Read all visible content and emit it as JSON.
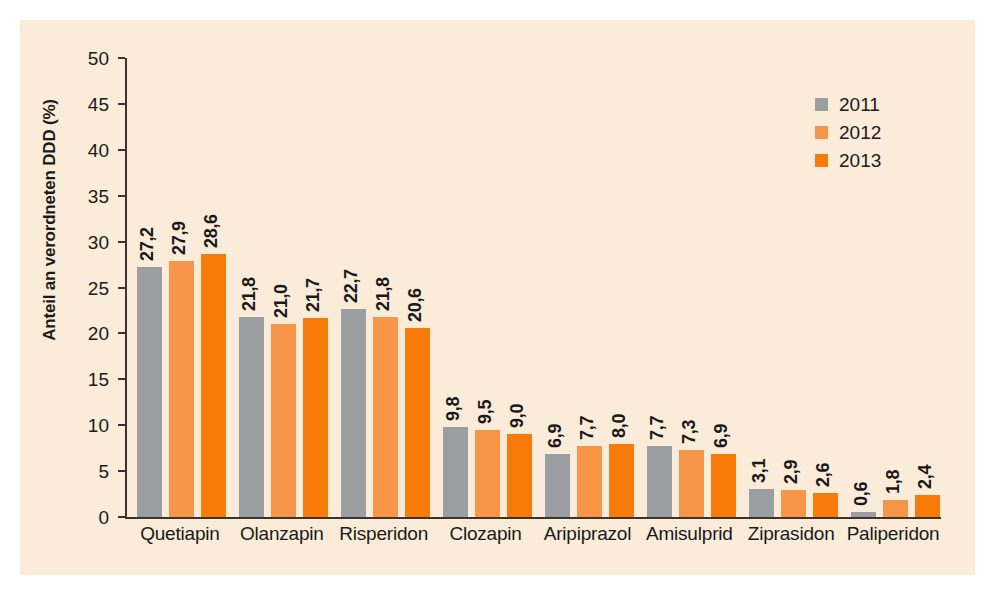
{
  "chart_data": {
    "type": "bar",
    "title": "",
    "xlabel": "",
    "ylabel": "Anteil an verordneten DDD (%)",
    "ylim": [
      0,
      50
    ],
    "ytick_step": 5,
    "yticks": [
      "50",
      "45",
      "40",
      "35",
      "30",
      "25",
      "20",
      "15",
      "10",
      "5",
      "0"
    ],
    "grid": false,
    "legend_position": "top-right",
    "decimal_separator": ",",
    "categories": [
      "Quetiapin",
      "Olanzapin",
      "Risperidon",
      "Clozapin",
      "Aripiprazol",
      "Amisulprid",
      "Ziprasidon",
      "Paliperidon"
    ],
    "series": [
      {
        "name": "2011",
        "color": "#9b9ea1",
        "values": [
          27.2,
          21.8,
          22.7,
          9.8,
          6.9,
          7.7,
          3.1,
          0.6
        ],
        "labels": [
          "27,2",
          "21,8",
          "22,7",
          "9,8",
          "6,9",
          "7,7",
          "3,1",
          "0,6"
        ]
      },
      {
        "name": "2012",
        "color": "#f79548",
        "values": [
          27.9,
          21.0,
          21.8,
          9.5,
          7.7,
          7.3,
          2.9,
          1.8
        ],
        "labels": [
          "27,9",
          "21,0",
          "21,8",
          "9,5",
          "7,7",
          "7,3",
          "2,9",
          "1,8"
        ]
      },
      {
        "name": "2013",
        "color": "#f87a09",
        "values": [
          28.6,
          21.7,
          20.6,
          9.0,
          8.0,
          6.9,
          2.6,
          2.4
        ],
        "labels": [
          "28,6",
          "21,7",
          "20,6",
          "9,0",
          "8,0",
          "6,9",
          "2,6",
          "2,4"
        ]
      }
    ]
  },
  "colors": {
    "background": "#ffffff",
    "panel": "#faecd8",
    "axis": "#3a3330",
    "text": "#1a1a1a",
    "series_2011": "#9b9ea1",
    "series_2012": "#f79548",
    "series_2013": "#f87a09"
  }
}
